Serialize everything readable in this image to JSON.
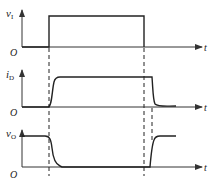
{
  "diagram": {
    "type": "timing-waveforms",
    "panels": [
      {
        "signal": "v",
        "subscript": "I",
        "axis_label": "t",
        "origin": "O"
      },
      {
        "signal": "i",
        "subscript": "D",
        "axis_label": "t",
        "origin": "O"
      },
      {
        "signal": "v",
        "subscript": "O",
        "axis_label": "t",
        "origin": "O"
      }
    ],
    "colors": {
      "line": "#222222",
      "axis": "#333333",
      "dash": "#222222"
    }
  }
}
